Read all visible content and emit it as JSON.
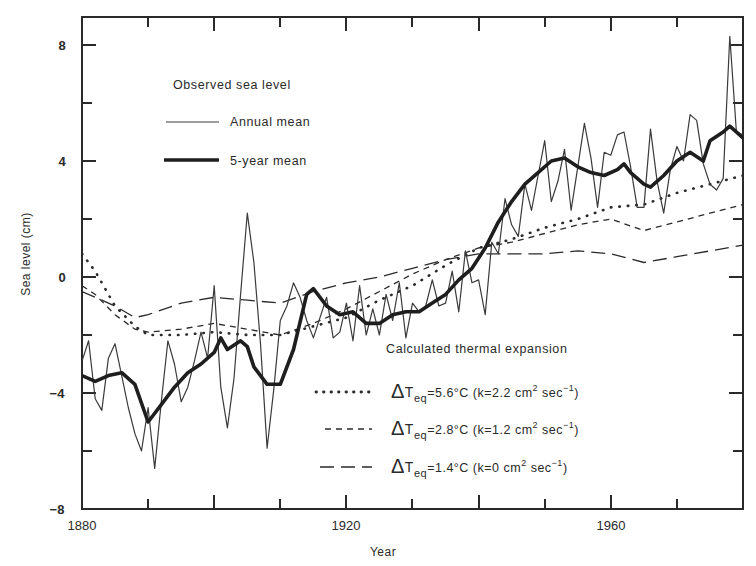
{
  "chart_data": {
    "type": "line",
    "title": "",
    "xlabel": "Year",
    "ylabel": "Sea level (cm)",
    "xlim": [
      1880,
      1980
    ],
    "ylim": [
      -8,
      9
    ],
    "x_ticks_major": [
      1880,
      1920,
      1960
    ],
    "x_ticks_minor": [
      1890,
      1900,
      1910,
      1930,
      1940,
      1950,
      1970,
      1980
    ],
    "y_ticks_major": [
      -8,
      -4,
      0,
      4,
      8
    ],
    "y_ticks_minor": [
      -6,
      -2,
      2,
      6
    ],
    "grid": false,
    "legend_groups": [
      {
        "title": "Observed sea level",
        "entries": [
          {
            "label": "Annual mean",
            "style": "thin-solid"
          },
          {
            "label": "5-year mean",
            "style": "thick-solid"
          }
        ],
        "position": "upper-left"
      },
      {
        "title": "Calculated thermal expansion",
        "entries": [
          {
            "label_prefix": "ΔT",
            "label_sub": "eq",
            "label_main": "=5.6°C (k=2.2 cm",
            "label_sup": "2",
            "label_tail": " sec",
            "label_sup2": "−1",
            "label_end": ")",
            "style": "dotted"
          },
          {
            "label_prefix": "ΔT",
            "label_sub": "eq",
            "label_main": "=2.8°C (k=1.2 cm",
            "label_sup": "2",
            "label_tail": " sec",
            "label_sup2": "−1",
            "label_end": ")",
            "style": "short-dash"
          },
          {
            "label_prefix": "ΔT",
            "label_sub": "eq",
            "label_main": "=1.4°C (k=0 cm",
            "label_sup": "2",
            "label_tail": " sec",
            "label_sup2": "−1",
            "label_end": ")",
            "style": "long-dash"
          }
        ],
        "position": "lower-right"
      }
    ],
    "series": [
      {
        "name": "Annual mean",
        "style": "thin-solid",
        "x": [
          1880,
          1881,
          1882,
          1883,
          1884,
          1885,
          1886,
          1887,
          1888,
          1889,
          1890,
          1891,
          1892,
          1893,
          1894,
          1895,
          1896,
          1897,
          1898,
          1899,
          1900,
          1901,
          1902,
          1903,
          1904,
          1905,
          1906,
          1907,
          1908,
          1909,
          1910,
          1911,
          1912,
          1913,
          1914,
          1915,
          1916,
          1917,
          1918,
          1919,
          1920,
          1921,
          1922,
          1923,
          1924,
          1925,
          1926,
          1927,
          1928,
          1929,
          1930,
          1931,
          1932,
          1933,
          1934,
          1935,
          1936,
          1937,
          1938,
          1939,
          1940,
          1941,
          1942,
          1943,
          1944,
          1945,
          1946,
          1947,
          1948,
          1949,
          1950,
          1951,
          1952,
          1953,
          1954,
          1955,
          1956,
          1957,
          1958,
          1959,
          1960,
          1961,
          1962,
          1963,
          1964,
          1965,
          1966,
          1967,
          1968,
          1969,
          1970,
          1971,
          1972,
          1973,
          1974,
          1975,
          1976,
          1977,
          1978,
          1979,
          1980
        ],
        "values": [
          -2.9,
          -2.2,
          -4.2,
          -4.6,
          -2.8,
          -2.3,
          -3.4,
          -4.5,
          -5.4,
          -6.0,
          -4.5,
          -6.6,
          -4.3,
          -2.2,
          -3.0,
          -4.3,
          -3.8,
          -2.9,
          -1.9,
          -2.8,
          -0.3,
          -3.8,
          -5.2,
          -3.5,
          -0.6,
          2.2,
          0.5,
          -2.3,
          -5.9,
          -3.9,
          -1.5,
          -1.0,
          -0.2,
          -0.7,
          -1.5,
          -2.1,
          -1.4,
          -0.7,
          -2.1,
          -1.9,
          -0.9,
          -2.2,
          -0.3,
          -2.0,
          -1.1,
          -2.0,
          -0.6,
          -1.5,
          -0.2,
          -2.1,
          -0.9,
          -1.2,
          -1.0,
          -0.1,
          -1.0,
          -0.9,
          0.2,
          -1.2,
          0.9,
          -0.2,
          -0.1,
          -1.3,
          1.2,
          0.8,
          2.7,
          1.8,
          1.4,
          3.2,
          2.3,
          3.5,
          4.7,
          2.6,
          3.3,
          4.4,
          2.3,
          3.8,
          5.3,
          4.1,
          2.4,
          4.3,
          4.2,
          4.9,
          5.0,
          3.8,
          2.4,
          2.4,
          5.1,
          3.3,
          2.2,
          3.7,
          4.5,
          4.0,
          5.6,
          5.4,
          3.9,
          3.2,
          3.0,
          3.4,
          8.3,
          5.0,
          4.9
        ]
      },
      {
        "name": "5-year mean",
        "style": "thick-solid",
        "x": [
          1880,
          1882,
          1884,
          1886,
          1888,
          1890,
          1892,
          1894,
          1896,
          1898,
          1900,
          1901,
          1902,
          1904,
          1905,
          1906,
          1908,
          1910,
          1912,
          1914,
          1915,
          1917,
          1919,
          1921,
          1923,
          1925,
          1927,
          1929,
          1931,
          1933,
          1935,
          1937,
          1939,
          1941,
          1943,
          1945,
          1947,
          1949,
          1951,
          1953,
          1955,
          1957,
          1959,
          1961,
          1962,
          1963,
          1965,
          1966,
          1968,
          1970,
          1972,
          1974,
          1975,
          1977,
          1978,
          1980
        ],
        "values": [
          -3.4,
          -3.6,
          -3.4,
          -3.3,
          -3.7,
          -5.0,
          -4.4,
          -3.8,
          -3.3,
          -3.0,
          -2.6,
          -2.1,
          -2.5,
          -2.2,
          -2.4,
          -3.1,
          -3.7,
          -3.7,
          -2.5,
          -0.6,
          -0.4,
          -1.0,
          -1.3,
          -1.2,
          -1.6,
          -1.6,
          -1.3,
          -1.2,
          -1.2,
          -0.9,
          -0.6,
          -0.1,
          0.3,
          1.0,
          1.9,
          2.6,
          3.2,
          3.6,
          4.0,
          4.1,
          3.8,
          3.6,
          3.5,
          3.7,
          3.9,
          3.6,
          3.2,
          3.1,
          3.5,
          4.0,
          4.3,
          4.0,
          4.7,
          5.0,
          5.2,
          4.8
        ]
      },
      {
        "name": "ΔTeq=5.6°C (k=2.2 cm² sec⁻¹)",
        "style": "dotted",
        "x": [
          1880,
          1882,
          1885,
          1888,
          1890,
          1895,
          1900,
          1905,
          1910,
          1915,
          1920,
          1925,
          1930,
          1935,
          1940,
          1945,
          1950,
          1955,
          1960,
          1965,
          1970,
          1975,
          1980
        ],
        "values": [
          0.8,
          0.2,
          -1.0,
          -1.7,
          -2.0,
          -2.0,
          -1.9,
          -2.0,
          -2.0,
          -1.7,
          -1.4,
          -0.8,
          -0.3,
          0.4,
          1.0,
          1.3,
          1.7,
          2.0,
          2.4,
          2.5,
          2.9,
          3.2,
          3.5
        ]
      },
      {
        "name": "ΔTeq=2.8°C (k=1.2 cm² sec⁻¹)",
        "style": "short-dash",
        "x": [
          1880,
          1882,
          1885,
          1888,
          1890,
          1895,
          1900,
          1905,
          1910,
          1915,
          1920,
          1925,
          1930,
          1935,
          1940,
          1945,
          1950,
          1955,
          1960,
          1965,
          1970,
          1975,
          1980
        ],
        "values": [
          -0.3,
          -0.6,
          -1.3,
          -1.8,
          -1.9,
          -1.8,
          -1.6,
          -1.8,
          -2.0,
          -1.6,
          -1.1,
          -0.5,
          0.1,
          0.6,
          1.0,
          1.2,
          1.5,
          1.8,
          2.0,
          1.6,
          1.9,
          2.2,
          2.5
        ]
      },
      {
        "name": "ΔTeq=1.4°C (k=0 cm² sec⁻¹)",
        "style": "long-dash",
        "x": [
          1880,
          1882,
          1885,
          1888,
          1890,
          1895,
          1900,
          1905,
          1910,
          1915,
          1920,
          1925,
          1930,
          1935,
          1940,
          1945,
          1950,
          1955,
          1960,
          1965,
          1970,
          1975,
          1980
        ],
        "values": [
          -0.5,
          -0.7,
          -1.0,
          -1.4,
          -1.3,
          -0.9,
          -0.7,
          -0.8,
          -0.9,
          -0.5,
          -0.2,
          0.0,
          0.3,
          0.6,
          0.8,
          0.8,
          0.8,
          0.9,
          0.8,
          0.5,
          0.7,
          0.9,
          1.1
        ]
      }
    ]
  },
  "labels": {
    "ylabel": "Sea level (cm)",
    "xlabel": "Year",
    "observed_title": "Observed sea level",
    "annual_mean": "Annual mean",
    "five_year_mean": "5-year mean",
    "thermal_title": "Calculated thermal expansion",
    "delta": "Δ",
    "T": "T",
    "eq": "eq",
    "entry1": "=5.6°C (k=2.2 cm",
    "entry2": "=2.8°C (k=1.2 cm",
    "entry3": "=1.4°C (k=0 cm",
    "sq": "2",
    "sec": " sec",
    "neg1": "−1",
    "close": ")"
  },
  "ticks": {
    "y8": "8",
    "y4": "4",
    "y0": "0",
    "ym4": "−4",
    "ym8": "−8",
    "x1880": "1880",
    "x1920": "1920",
    "x1960": "1960"
  },
  "colors": {
    "ink": "#2a2a2a",
    "background": "#ffffff"
  }
}
